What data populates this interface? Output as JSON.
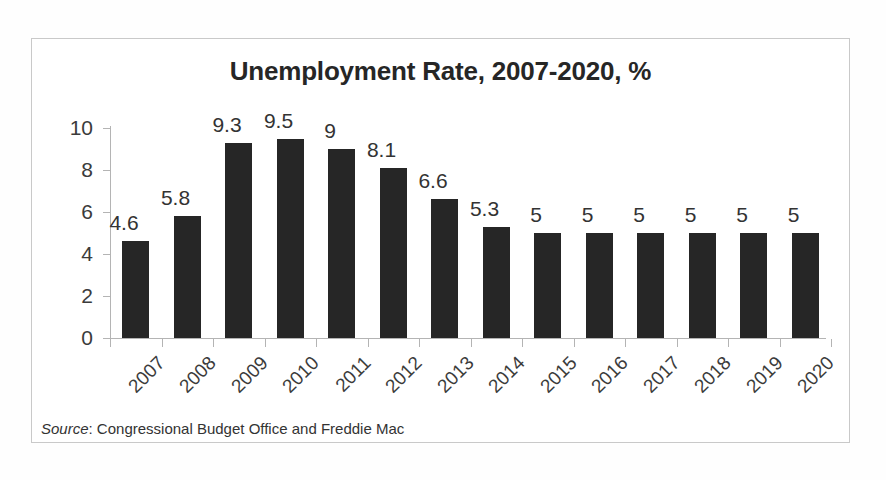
{
  "figure": {
    "title": "Unemployment Rate, 2007-2020, %",
    "source_lead": "Source",
    "source_rest": ": Congressional Budget Office and Freddie Mac",
    "bar_color": "#262626",
    "axis_color": "#b4b4b4",
    "text_color": "#333333",
    "frame_color": "#c9c9c9",
    "background": "#ffffff"
  },
  "chart_data": {
    "type": "bar",
    "title": "Unemployment Rate, 2007-2020, %",
    "xlabel": "",
    "ylabel": "",
    "ylim": [
      0,
      10
    ],
    "yticks": [
      0,
      2,
      4,
      6,
      8,
      10
    ],
    "ytick_labels": [
      "0",
      "2",
      "4",
      "6",
      "8",
      "10"
    ],
    "grid": false,
    "legend": false,
    "data_labels": true,
    "categories": [
      "2007",
      "2008",
      "2009",
      "2010",
      "2011",
      "2012",
      "2013",
      "2014",
      "2015",
      "2016",
      "2017",
      "2018",
      "2019",
      "2020"
    ],
    "values": [
      4.6,
      5.8,
      9.3,
      9.5,
      9,
      8.1,
      6.6,
      5.3,
      5,
      5,
      5,
      5,
      5,
      5
    ],
    "value_labels": [
      "4.6",
      "5.8",
      "9.3",
      "9.5",
      "9",
      "8.1",
      "6.6",
      "5.3",
      "5",
      "5",
      "5",
      "5",
      "5",
      "5"
    ],
    "series": [
      {
        "name": "Unemployment Rate",
        "values": [
          4.6,
          5.8,
          9.3,
          9.5,
          9,
          8.1,
          6.6,
          5.3,
          5,
          5,
          5,
          5,
          5,
          5
        ]
      }
    ],
    "annotations": [
      "Source: Congressional Budget Office and Freddie Mac"
    ]
  }
}
